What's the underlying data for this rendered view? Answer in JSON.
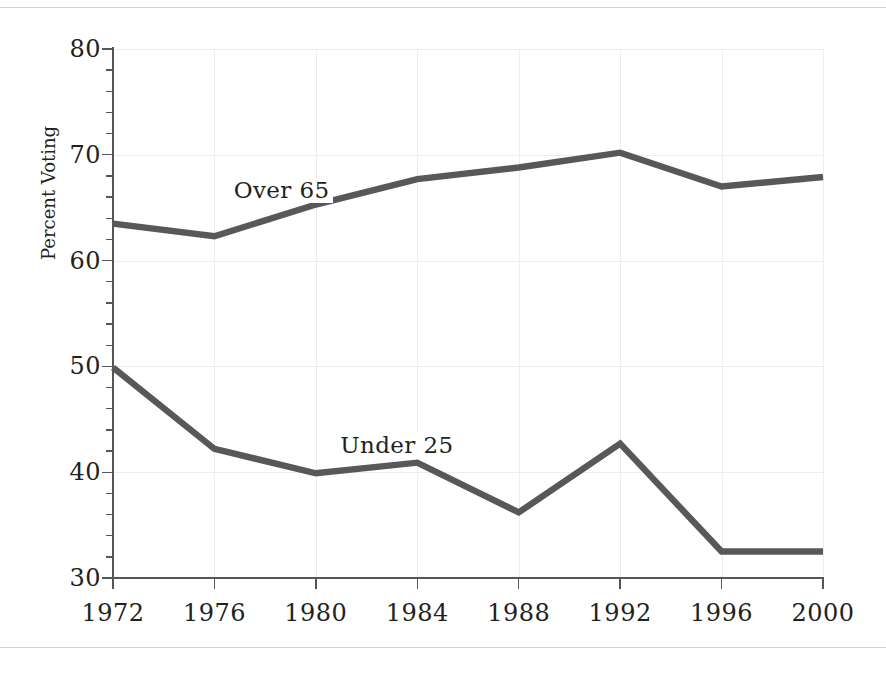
{
  "figure": {
    "line_color": "#58585a",
    "gridline_color": "#ededee",
    "axis_color": "#56565a",
    "background_color": "#ffffff"
  },
  "axis": {
    "y_title": "Percent Voting",
    "y_tick_labels": [
      "30",
      "40",
      "50",
      "60",
      "70",
      "80"
    ],
    "x_tick_labels": [
      "1972",
      "1976",
      "1980",
      "1984",
      "1988",
      "1992",
      "1996",
      "2000"
    ]
  },
  "series_labels": {
    "over65": "Over 65",
    "under25": "Under 25"
  },
  "chart_data": {
    "type": "line",
    "title": "",
    "xlabel": "",
    "ylabel": "Percent Voting",
    "x": [
      1972,
      1976,
      1980,
      1984,
      1988,
      1992,
      1996,
      2000
    ],
    "categories": [
      "1972",
      "1976",
      "1980",
      "1984",
      "1988",
      "1992",
      "1996",
      "2000"
    ],
    "xlim": [
      1972,
      2000
    ],
    "ylim": [
      30,
      80
    ],
    "y_ticks": [
      30,
      40,
      50,
      60,
      70,
      80
    ],
    "y_minor_tick_interval": 2,
    "grid": true,
    "legend_position": "inline-labels",
    "series": [
      {
        "name": "Over 65",
        "color": "#58585a",
        "values": [
          63.5,
          62.3,
          65.3,
          67.7,
          68.8,
          70.2,
          67.0,
          67.9
        ],
        "label_x": 1976.6,
        "label_y": 66.6
      },
      {
        "name": "Under 25",
        "color": "#58585a",
        "values": [
          49.9,
          42.2,
          39.9,
          40.9,
          36.2,
          42.7,
          32.5,
          32.5
        ],
        "label_x": 1980.8,
        "label_y": 42.5
      }
    ]
  }
}
